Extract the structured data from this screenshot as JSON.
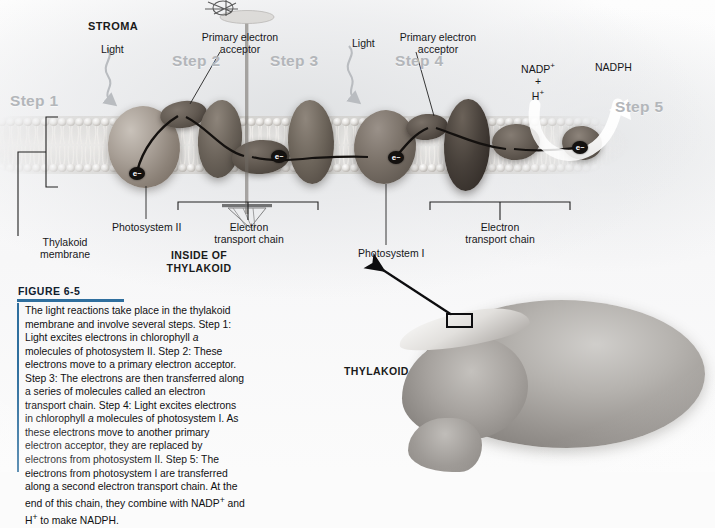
{
  "figure": {
    "number": "FIGURE 6-5",
    "accent_color": "#2f6f9e",
    "caption": "The light reactions take place in the thylakoid membrane and involve several steps. Step 1: Light excites electrons in chlorophyll a molecules of photosystem II. Step 2: These electrons move to a primary electron acceptor. Step 3: The electrons are then transferred along a series of molecules called an electron transport chain. Step 4: Light excites electrons in chlorophyll a molecules of photosystem I. As these electrons move to another primary electron acceptor, they are replaced by electrons from photosystem II. Step 5: The electrons from photosystem I are transferred along a second electron transport chain. At the end of this chain, they combine with NADP+ and H+ to make NADPH."
  },
  "diagram": {
    "compartment_top": "STROMA",
    "compartment_bottom_line1": "INSIDE OF",
    "compartment_bottom_line2": "THYLAKOID",
    "steps": [
      {
        "id": "step-1",
        "label": "Step 1"
      },
      {
        "id": "step-2",
        "label": "Step 2"
      },
      {
        "id": "step-3",
        "label": "Step 3"
      },
      {
        "id": "step-4",
        "label": "Step 4"
      },
      {
        "id": "step-5",
        "label": "Step 5"
      }
    ],
    "step_color": "#b3b6ba",
    "light_labels": [
      {
        "id": "light-left",
        "label": "Light"
      },
      {
        "id": "light-right",
        "label": "Light"
      }
    ],
    "acceptors": [
      {
        "id": "acceptor-left",
        "line1": "Primary electron",
        "line2": "acceptor"
      },
      {
        "id": "acceptor-right",
        "line1": "Primary electron",
        "line2": "acceptor"
      }
    ],
    "photosystems": [
      {
        "id": "photosystem-2",
        "label": "Photosystem II"
      },
      {
        "id": "photosystem-1",
        "label": "Photosystem I"
      }
    ],
    "transport_chains": [
      {
        "id": "etc-left",
        "line1": "Electron",
        "line2": "transport chain"
      },
      {
        "id": "etc-right",
        "line1": "Electron",
        "line2": "transport chain"
      }
    ],
    "membrane_label": {
      "line1": "Thylakoid",
      "line2": "membrane"
    },
    "nadp": {
      "line1": "NADP",
      "sup1": "+",
      "line2": "+",
      "line3": "H",
      "sup3": "+"
    },
    "nadph_label": "NADPH",
    "electron_symbol": "e",
    "electron_superscript": "−",
    "organelle_label": "THYLAKOID"
  }
}
